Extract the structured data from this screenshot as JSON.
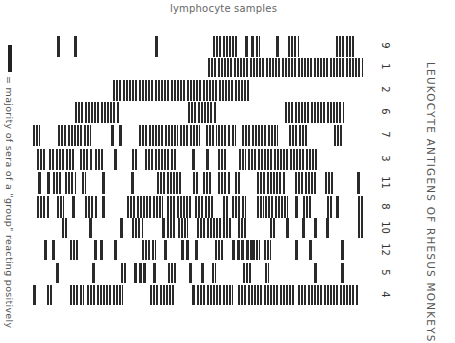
{
  "header": {
    "top_title": "lymphocyte samples"
  },
  "side_title": "LEUKOCYTE ANTIGENS OF RHESUS MONKEYS",
  "legend": {
    "symbol": "black-bar",
    "text": "= majority of sera of a \"group\" reacting positively"
  },
  "chart_data": {
    "type": "heatmap",
    "title": "LEUKOCYTE ANTIGENS OF RHESUS MONKEYS",
    "xlabel": "lymphocyte samples",
    "ylabel": "",
    "legend": [
      "= majority of sera of a \"group\" reacting positively"
    ],
    "row_labels": [
      "9",
      "1",
      "2",
      "6",
      "7",
      "3",
      "11",
      "8",
      "10",
      "12",
      "5",
      "4"
    ],
    "x_range_px": [
      30,
      365
    ],
    "rows": [
      {
        "label": "9",
        "top": 36,
        "height": 21,
        "segments": [
          [
            57,
            59
          ],
          [
            74,
            76
          ],
          [
            155,
            157
          ],
          [
            213,
            236
          ],
          [
            245,
            247
          ],
          [
            251,
            253
          ],
          [
            256,
            259
          ],
          [
            276,
            278
          ],
          [
            288,
            298
          ],
          [
            336,
            353
          ]
        ]
      },
      {
        "label": "1",
        "top": 58,
        "height": 19,
        "segments": [
          [
            208,
            362
          ]
        ]
      },
      {
        "label": "2",
        "top": 80,
        "height": 21,
        "segments": [
          [
            113,
            249
          ]
        ]
      },
      {
        "label": "6",
        "top": 102,
        "height": 21,
        "segments": [
          [
            75,
            119
          ],
          [
            188,
            216
          ],
          [
            285,
            343
          ]
        ]
      },
      {
        "label": "7",
        "top": 125,
        "height": 21,
        "segments": [
          [
            33,
            39
          ],
          [
            58,
            90
          ],
          [
            111,
            113
          ],
          [
            119,
            121
          ],
          [
            139,
            177
          ],
          [
            180,
            199
          ],
          [
            206,
            216
          ],
          [
            218,
            229
          ],
          [
            232,
            235
          ],
          [
            242,
            277
          ],
          [
            289,
            307
          ],
          [
            334,
            343
          ]
        ]
      },
      {
        "label": "3",
        "top": 149,
        "height": 21,
        "segments": [
          [
            37,
            45
          ],
          [
            49,
            53
          ],
          [
            56,
            63
          ],
          [
            66,
            75
          ],
          [
            80,
            92
          ],
          [
            95,
            102
          ],
          [
            114,
            116
          ],
          [
            132,
            137
          ],
          [
            145,
            175
          ],
          [
            192,
            194
          ],
          [
            206,
            208
          ],
          [
            218,
            227
          ],
          [
            239,
            245
          ],
          [
            248,
            317
          ]
        ]
      },
      {
        "label": "11",
        "top": 172,
        "height": 22,
        "segments": [
          [
            38,
            40
          ],
          [
            47,
            49
          ],
          [
            53,
            62
          ],
          [
            65,
            75
          ],
          [
            82,
            85
          ],
          [
            102,
            104
          ],
          [
            131,
            133
          ],
          [
            157,
            180
          ],
          [
            193,
            197
          ],
          [
            203,
            212
          ],
          [
            218,
            230
          ],
          [
            235,
            240
          ],
          [
            257,
            285
          ],
          [
            295,
            315
          ],
          [
            325,
            332
          ],
          [
            357,
            359
          ]
        ]
      },
      {
        "label": "8",
        "top": 196,
        "height": 22,
        "segments": [
          [
            37,
            48
          ],
          [
            57,
            63
          ],
          [
            72,
            74
          ],
          [
            85,
            97
          ],
          [
            102,
            104
          ],
          [
            127,
            157
          ],
          [
            159,
            162
          ],
          [
            167,
            192
          ],
          [
            195,
            213
          ],
          [
            223,
            228
          ],
          [
            232,
            245
          ],
          [
            257,
            263
          ],
          [
            265,
            287
          ],
          [
            295,
            297
          ],
          [
            303,
            310
          ],
          [
            327,
            332
          ],
          [
            336,
            338
          ],
          [
            358,
            363
          ]
        ]
      },
      {
        "label": "10",
        "top": 218,
        "height": 20,
        "segments": [
          [
            62,
            67
          ],
          [
            89,
            91
          ],
          [
            120,
            122
          ],
          [
            132,
            142
          ],
          [
            162,
            164
          ],
          [
            167,
            175
          ],
          [
            178,
            182
          ],
          [
            184,
            187
          ],
          [
            197,
            230
          ],
          [
            238,
            247
          ],
          [
            270,
            275
          ],
          [
            286,
            288
          ],
          [
            302,
            304
          ],
          [
            314,
            316
          ],
          [
            326,
            328
          ],
          [
            358,
            362
          ]
        ]
      },
      {
        "label": "12",
        "top": 240,
        "height": 20,
        "segments": [
          [
            44,
            46
          ],
          [
            52,
            54
          ],
          [
            70,
            78
          ],
          [
            94,
            96
          ],
          [
            100,
            102
          ],
          [
            114,
            116
          ],
          [
            142,
            155
          ],
          [
            164,
            166
          ],
          [
            181,
            183
          ],
          [
            186,
            188
          ],
          [
            195,
            197
          ],
          [
            215,
            222
          ],
          [
            232,
            234
          ],
          [
            237,
            239
          ],
          [
            241,
            243
          ],
          [
            246,
            248
          ],
          [
            250,
            252
          ],
          [
            253,
            259
          ],
          [
            264,
            270
          ],
          [
            295,
            297
          ],
          [
            309,
            311
          ],
          [
            341,
            343
          ]
        ]
      },
      {
        "label": "5",
        "top": 263,
        "height": 20,
        "segments": [
          [
            56,
            58
          ],
          [
            92,
            94
          ],
          [
            121,
            125
          ],
          [
            134,
            136
          ],
          [
            139,
            141
          ],
          [
            143,
            145
          ],
          [
            153,
            155
          ],
          [
            168,
            175
          ],
          [
            189,
            191
          ],
          [
            201,
            203
          ],
          [
            212,
            215
          ],
          [
            243,
            252
          ],
          [
            265,
            268
          ],
          [
            314,
            316
          ],
          [
            341,
            343
          ]
        ]
      },
      {
        "label": "4",
        "top": 285,
        "height": 20,
        "segments": [
          [
            33,
            35
          ],
          [
            47,
            52
          ],
          [
            70,
            83
          ],
          [
            87,
            122
          ],
          [
            150,
            175
          ],
          [
            192,
            194
          ],
          [
            197,
            232
          ],
          [
            238,
            295
          ],
          [
            298,
            358
          ]
        ]
      }
    ]
  },
  "row_label_positions": [
    46,
    67,
    90,
    112,
    135,
    159,
    183,
    207,
    228,
    250,
    273,
    295
  ]
}
